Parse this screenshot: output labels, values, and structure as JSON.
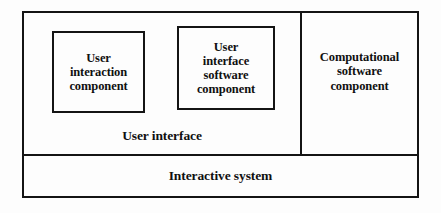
{
  "diagram": {
    "type": "nested-block-diagram",
    "title_text": null,
    "colors": {
      "stroke": "#141414",
      "background": "#fdfdfd",
      "text": "#101010"
    },
    "outer_region": {
      "name": "interactive-system",
      "label": "Interactive system"
    },
    "regions": [
      {
        "name": "user-interface",
        "label": "User interface"
      },
      {
        "name": "computational-software-component",
        "label": "Computational\nsoftware\ncomponent"
      }
    ],
    "components": [
      {
        "name": "user-interaction-component",
        "label": "User\ninteraction\ncomponent"
      },
      {
        "name": "user-interface-software-component",
        "label": "User\ninterface\nsoftware\ncomponent"
      }
    ]
  }
}
